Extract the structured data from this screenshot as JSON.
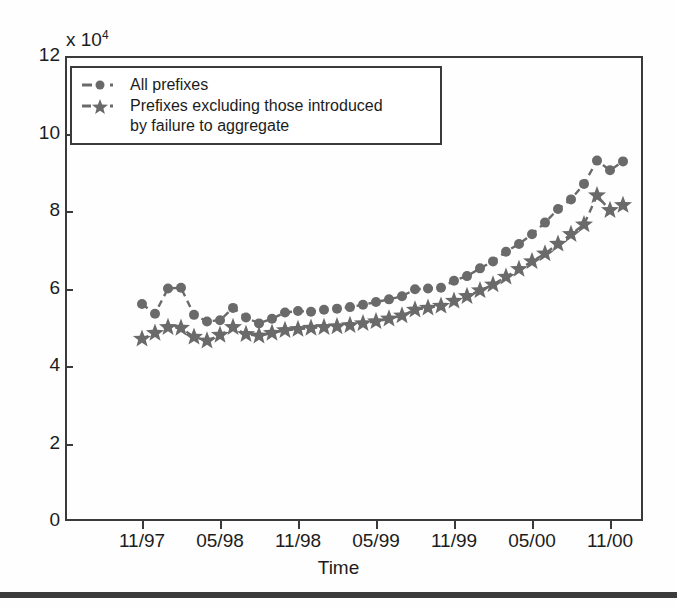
{
  "chart_data": {
    "type": "line",
    "title": "",
    "xlabel": "Time",
    "ylabel": "",
    "y_multiplier": "x 10",
    "y_multiplier_exponent": "4",
    "xlim_labels": [
      "11/97",
      "05/98",
      "11/98",
      "05/99",
      "11/99",
      "05/00",
      "11/00"
    ],
    "ylim": [
      0,
      120000
    ],
    "yticks": [
      0,
      2,
      4,
      6,
      8,
      10,
      12
    ],
    "ytick_labels": [
      "0",
      "2",
      "4",
      "6",
      "8",
      "10",
      "12"
    ],
    "xticks": [
      "11/97",
      "05/98",
      "11/98",
      "05/99",
      "11/99",
      "05/00",
      "11/00"
    ],
    "grid": false,
    "legend_position": "upper-left",
    "marker_color": "#6a6a6a",
    "axis_color": "#3a3a3a",
    "x": [
      "11/97",
      "12/97",
      "01/98",
      "02/98",
      "03/98",
      "04/98",
      "05/98",
      "06/98",
      "07/98",
      "08/98",
      "09/98",
      "10/98",
      "11/98",
      "12/98",
      "01/99",
      "02/99",
      "03/99",
      "04/99",
      "05/99",
      "06/99",
      "07/99",
      "08/99",
      "09/99",
      "10/99",
      "11/99",
      "12/99",
      "01/00",
      "02/00",
      "03/00",
      "04/00",
      "05/00",
      "06/00",
      "07/00",
      "08/00",
      "09/00",
      "10/00",
      "11/00",
      "12/00"
    ],
    "series": [
      {
        "name": "All prefixes",
        "marker": "circle",
        "linestyle": "dashed",
        "values": [
          56000,
          53500,
          60000,
          60200,
          53200,
          51500,
          51800,
          55000,
          52500,
          51000,
          52200,
          53800,
          54200,
          54000,
          54500,
          54800,
          55200,
          55800,
          56500,
          57200,
          58000,
          59800,
          60000,
          60200,
          62000,
          63200,
          65200,
          67000,
          69500,
          71500,
          74000,
          77000,
          80500,
          83000,
          87000,
          93000,
          90500,
          92800
        ]
      },
      {
        "name": "Prefixes excluding those introduced\nby failure to aggregate",
        "marker": "star",
        "linestyle": "dashed",
        "values": [
          47000,
          48500,
          50000,
          49800,
          47500,
          46500,
          48000,
          50000,
          48200,
          47800,
          48500,
          49200,
          49500,
          49800,
          50000,
          50200,
          50500,
          51000,
          51500,
          52200,
          53000,
          54500,
          55000,
          55500,
          56800,
          58000,
          59500,
          61000,
          63000,
          65000,
          67000,
          69000,
          71500,
          74000,
          76500,
          84000,
          80200,
          81500
        ]
      }
    ]
  },
  "legend": {
    "entries": [
      {
        "label": "All prefixes",
        "marker": "circle-marker"
      },
      {
        "label": "Prefixes excluding those introduced\nby failure to aggregate",
        "marker": "star-marker"
      }
    ]
  },
  "axes": {
    "y_multiplier_text": "x 10",
    "y_multiplier_sup": "4",
    "x_title": "Time",
    "y_tick_labels": [
      "12",
      "10",
      "8",
      "6",
      "4",
      "2",
      "0"
    ],
    "x_tick_labels": [
      "11/97",
      "05/98",
      "11/98",
      "05/99",
      "11/99",
      "05/00",
      "11/00"
    ]
  }
}
